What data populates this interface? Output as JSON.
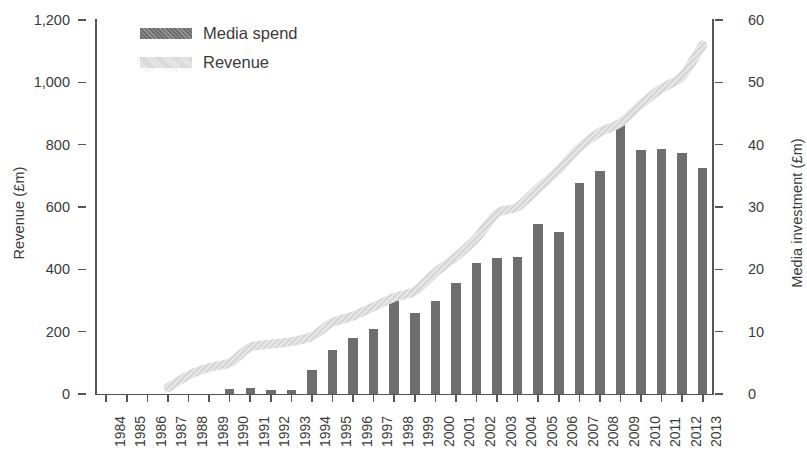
{
  "chart_data": {
    "type": "bar",
    "title": "",
    "subtitle": "",
    "xlabel": "",
    "ylabel": "Revenue (£m)",
    "y2label": "Media investment (£m)",
    "grid": false,
    "legend_position": "top-left",
    "categories": [
      "1984",
      "1985",
      "1986",
      "1987",
      "1988",
      "1989",
      "1990",
      "1991",
      "1992",
      "1993",
      "1994",
      "1995",
      "1996",
      "1997",
      "1998",
      "1999",
      "2000",
      "2001",
      "2002",
      "2003",
      "2004",
      "2005",
      "2006",
      "2007",
      "2008",
      "2009",
      "2010",
      "2011",
      "2012",
      "2013"
    ],
    "yticks": [
      "0",
      "200",
      "400",
      "600",
      "800",
      "1,000",
      "1,200"
    ],
    "ytick_values": [
      0,
      200,
      400,
      600,
      800,
      1000,
      1200
    ],
    "ylim": [
      0,
      1200
    ],
    "y2ticks": [
      "0",
      "10",
      "20",
      "30",
      "40",
      "50",
      "60"
    ],
    "y2tick_values": [
      0,
      10,
      20,
      30,
      40,
      50,
      60
    ],
    "y2lim": [
      0,
      60
    ],
    "series": [
      {
        "name": "Media spend",
        "kind": "bar",
        "axis": "right",
        "color": "#6e6e6e",
        "values": [
          0,
          0,
          0,
          0,
          0,
          0,
          0.8,
          0.9,
          0.7,
          0.7,
          3.8,
          7.0,
          9.0,
          10.5,
          15.3,
          13.0,
          15.0,
          17.8,
          21.0,
          21.8,
          22.0,
          27.2,
          26.0,
          33.8,
          35.8,
          43.7,
          39.2,
          39.3,
          38.7,
          36.3
        ]
      },
      {
        "name": "Revenue",
        "kind": "line",
        "axis": "left",
        "color": "#d2d2d2",
        "values": [
          null,
          null,
          null,
          20,
          60,
          85,
          100,
          150,
          160,
          168,
          185,
          230,
          250,
          280,
          310,
          330,
          390,
          440,
          500,
          580,
          600,
          660,
          720,
          790,
          840,
          870,
          930,
          980,
          1020,
          1120
        ]
      }
    ]
  },
  "legend": {
    "items": [
      {
        "label": "Media spend",
        "swatch": "bar"
      },
      {
        "label": "Revenue",
        "swatch": "line"
      }
    ]
  }
}
